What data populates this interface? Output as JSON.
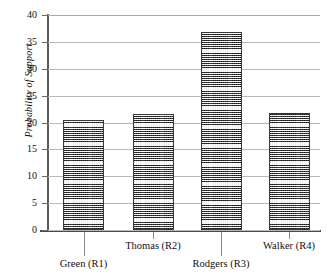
{
  "chart_data": {
    "type": "bar",
    "title": "",
    "subtitle": "",
    "xlabel": "",
    "ylabel": "Probability of Support",
    "categories": [
      "Green (R1)",
      "Thomas (R2)",
      "Rodgers (R3)",
      "Walker (R4)"
    ],
    "values": [
      20.4,
      21.6,
      36.9,
      21.7
    ],
    "ylim": [
      0,
      40
    ],
    "ytick_step": 5,
    "ytick_labels": [
      "0",
      "5",
      "10",
      "15",
      "20",
      "25",
      "30",
      "35",
      "40"
    ],
    "grid": "horizontal",
    "legend": "none",
    "bar_fill": "fine-checkerboard-hatch",
    "bar_edge_color": "#3a3a3a",
    "bar_fill_color": "#9d9d9d",
    "gridline_color": "#b9b9b9",
    "axis_color": "#4a4a4a",
    "label_stagger": [
      "lower",
      "upper",
      "lower",
      "upper"
    ]
  },
  "axes": {
    "y_title": "Probability of Support"
  }
}
